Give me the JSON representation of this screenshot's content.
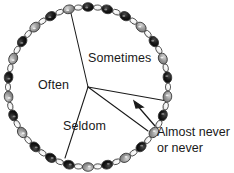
{
  "figure": {
    "type": "illustration-pie-chart",
    "background_color": "#ffffff",
    "line_color": "#1a1a1a",
    "bead_colors": {
      "dark": "#141414",
      "light": "#9a9a9a",
      "link": "#f2f2f2",
      "outline": "#3a3a3a"
    }
  },
  "chart_data": {
    "type": "pie",
    "title": "",
    "subtitle": "",
    "xlabel": "",
    "ylabel": "",
    "legend_position": "none",
    "grid": false,
    "center": {
      "x": 88,
      "y": 87
    },
    "radius": 80,
    "categories": [
      "Often",
      "Sometimes",
      "Seldom",
      "Almost never or never"
    ],
    "values": [
      38,
      31,
      22,
      9
    ],
    "annotations": [
      "Almost never",
      "or never"
    ],
    "slices": [
      {
        "label": "Often",
        "value": 38,
        "start_angle_deg": 166,
        "end_angle_deg": 283,
        "label_x": 38,
        "label_y": 78
      },
      {
        "label": "Sometimes",
        "value": 31,
        "start_angle_deg": 283,
        "end_angle_deg": 370,
        "label_x": 88,
        "label_y": 51
      },
      {
        "label": "Seldom",
        "value": 22,
        "start_angle_deg": 100,
        "end_angle_deg": 166,
        "label_x": 63,
        "label_y": 119
      },
      {
        "label": "Almost never or never",
        "value": 9,
        "start_angle_deg": 10,
        "end_angle_deg": 100,
        "label_x": 157,
        "label_y": 124
      }
    ]
  },
  "labels": {
    "often": "Often",
    "sometimes": "Sometimes",
    "seldom": "Seldom",
    "almost_never_line1": "Almost never",
    "almost_never_line2": "or never"
  }
}
